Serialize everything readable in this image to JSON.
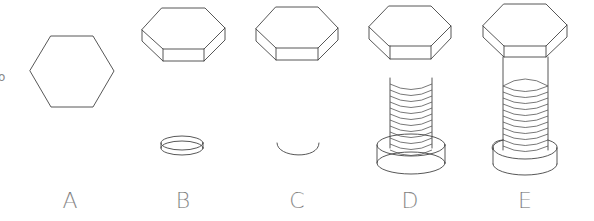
{
  "figure": {
    "stroke_color": "#444444",
    "background": "#ffffff"
  },
  "steps": [
    {
      "label": "A",
      "content": "Flat hexagon outline"
    },
    {
      "label": "B",
      "content": "Hexagonal prism head with ring ellipse below"
    },
    {
      "label": "C",
      "content": "Hexagonal prism head with lower ellipse arc"
    },
    {
      "label": "D",
      "content": "Hex head with threaded cylinder through transparent collar"
    },
    {
      "label": "E",
      "content": "Completed hex bolt with threaded shank and collar"
    }
  ],
  "edge_mark": "o"
}
